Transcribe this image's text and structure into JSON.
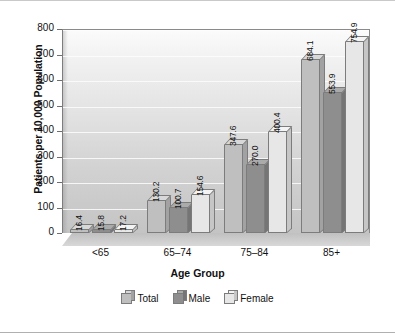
{
  "chart_data": {
    "type": "bar",
    "title": "",
    "xlabel": "Age Group",
    "ylabel": "Patients per 10,000 Population",
    "categories": [
      "<65",
      "65–74",
      "75–84",
      "85+"
    ],
    "series": [
      {
        "name": "Total",
        "values": [
          16.4,
          130.2,
          347.6,
          684.1
        ]
      },
      {
        "name": "Male",
        "values": [
          15.8,
          100.7,
          270.0,
          553.9
        ]
      },
      {
        "name": "Female",
        "values": [
          17.2,
          154.6,
          400.4,
          754.9
        ]
      }
    ],
    "ylim": [
      0,
      800
    ],
    "yticks": [
      0,
      100,
      200,
      300,
      400,
      500,
      600,
      700,
      800
    ],
    "ytick_labels": [
      "0",
      "100",
      "200",
      "300",
      "400",
      "500",
      "600",
      "700",
      "800"
    ],
    "grid": true,
    "legend_position": "bottom",
    "style": "3d-bar",
    "colors": {
      "total": "#bfbfbf",
      "male": "#8e8e8e",
      "female": "#e7e7e7",
      "outline": "#7c7c7c",
      "gridline": "#fdfdfd",
      "text": "#111111"
    },
    "value_labels": [
      [
        "16.4",
        "15.8",
        "17.2"
      ],
      [
        "130.2",
        "100.7",
        "154.6"
      ],
      [
        "347.6",
        "270.0",
        "400.4"
      ],
      [
        "684.1",
        "553.9",
        "754.9"
      ]
    ]
  },
  "legend": {
    "items": [
      {
        "label": "Total"
      },
      {
        "label": "Male"
      },
      {
        "label": "Female"
      }
    ]
  }
}
